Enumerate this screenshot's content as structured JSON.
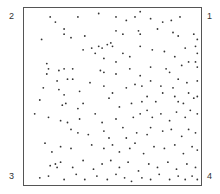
{
  "figure": {
    "corner_labels": {
      "top_right": "1",
      "top_left": "2",
      "bottom_left": "3",
      "bottom_right": "4"
    },
    "colors": {
      "point": "#333333",
      "frame": "#555555",
      "label": "#333333"
    }
  },
  "chart_data": {
    "type": "scatter",
    "title": "",
    "xlabel": "",
    "ylabel": "",
    "xlim": [
      0,
      1
    ],
    "ylim": [
      0,
      1
    ],
    "grid": false,
    "legend": null,
    "annotations": [
      {
        "text": "1",
        "position": "top-right corner"
      },
      {
        "text": "2",
        "position": "top-left corner"
      },
      {
        "text": "3",
        "position": "bottom-left corner"
      },
      {
        "text": "4",
        "position": "bottom-right corner"
      }
    ],
    "note": "Point pattern in unit square; density increases toward the right edge (corners 1 and 4). Coordinates estimated from pixels.",
    "points": [
      [
        0.14,
        0.96
      ],
      [
        0.17,
        0.93
      ],
      [
        0.3,
        0.96
      ],
      [
        0.42,
        0.98
      ],
      [
        0.52,
        0.96
      ],
      [
        0.58,
        0.94
      ],
      [
        0.63,
        0.96
      ],
      [
        0.66,
        0.99
      ],
      [
        0.72,
        0.95
      ],
      [
        0.79,
        0.93
      ],
      [
        0.84,
        0.94
      ],
      [
        0.89,
        0.96
      ],
      [
        0.22,
        0.89
      ],
      [
        0.22,
        0.86
      ],
      [
        0.26,
        0.84
      ],
      [
        0.34,
        0.85
      ],
      [
        0.09,
        0.83
      ],
      [
        0.52,
        0.88
      ],
      [
        0.56,
        0.86
      ],
      [
        0.65,
        0.88
      ],
      [
        0.66,
        0.86
      ],
      [
        0.76,
        0.89
      ],
      [
        0.85,
        0.87
      ],
      [
        0.88,
        0.85
      ],
      [
        0.97,
        0.86
      ],
      [
        0.99,
        0.83
      ],
      [
        0.33,
        0.77
      ],
      [
        0.38,
        0.78
      ],
      [
        0.42,
        0.79
      ],
      [
        0.44,
        0.78
      ],
      [
        0.47,
        0.8
      ],
      [
        0.49,
        0.81
      ],
      [
        0.5,
        0.79
      ],
      [
        0.4,
        0.75
      ],
      [
        0.45,
        0.72
      ],
      [
        0.52,
        0.7
      ],
      [
        0.56,
        0.75
      ],
      [
        0.6,
        0.73
      ],
      [
        0.66,
        0.79
      ],
      [
        0.73,
        0.77
      ],
      [
        0.8,
        0.76
      ],
      [
        0.86,
        0.73
      ],
      [
        0.92,
        0.78
      ],
      [
        0.98,
        0.79
      ],
      [
        0.99,
        0.75
      ],
      [
        0.12,
        0.69
      ],
      [
        0.13,
        0.66
      ],
      [
        0.19,
        0.65
      ],
      [
        0.22,
        0.66
      ],
      [
        0.27,
        0.66
      ],
      [
        0.12,
        0.63
      ],
      [
        0.18,
        0.59
      ],
      [
        0.24,
        0.6
      ],
      [
        0.27,
        0.6
      ],
      [
        0.37,
        0.58
      ],
      [
        0.43,
        0.65
      ],
      [
        0.45,
        0.64
      ],
      [
        0.52,
        0.63
      ],
      [
        0.6,
        0.66
      ],
      [
        0.66,
        0.62
      ],
      [
        0.72,
        0.67
      ],
      [
        0.81,
        0.66
      ],
      [
        0.83,
        0.64
      ],
      [
        0.9,
        0.68
      ],
      [
        0.94,
        0.7
      ],
      [
        0.98,
        0.7
      ],
      [
        0.99,
        0.67
      ],
      [
        0.1,
        0.55
      ],
      [
        0.19,
        0.54
      ],
      [
        0.22,
        0.51
      ],
      [
        0.31,
        0.53
      ],
      [
        0.45,
        0.56
      ],
      [
        0.5,
        0.52
      ],
      [
        0.58,
        0.55
      ],
      [
        0.63,
        0.57
      ],
      [
        0.67,
        0.56
      ],
      [
        0.72,
        0.59
      ],
      [
        0.78,
        0.56
      ],
      [
        0.85,
        0.55
      ],
      [
        0.88,
        0.6
      ],
      [
        0.93,
        0.58
      ],
      [
        0.99,
        0.59
      ],
      [
        0.08,
        0.48
      ],
      [
        0.21,
        0.45
      ],
      [
        0.23,
        0.46
      ],
      [
        0.3,
        0.43
      ],
      [
        0.33,
        0.46
      ],
      [
        0.4,
        0.4
      ],
      [
        0.48,
        0.49
      ],
      [
        0.54,
        0.44
      ],
      [
        0.61,
        0.46
      ],
      [
        0.67,
        0.47
      ],
      [
        0.7,
        0.5
      ],
      [
        0.75,
        0.47
      ],
      [
        0.79,
        0.52
      ],
      [
        0.86,
        0.5
      ],
      [
        0.88,
        0.47
      ],
      [
        0.91,
        0.46
      ],
      [
        0.94,
        0.52
      ],
      [
        0.97,
        0.49
      ],
      [
        0.99,
        0.5
      ],
      [
        0.05,
        0.4
      ],
      [
        0.13,
        0.38
      ],
      [
        0.2,
        0.36
      ],
      [
        0.24,
        0.35
      ],
      [
        0.31,
        0.37
      ],
      [
        0.44,
        0.35
      ],
      [
        0.52,
        0.37
      ],
      [
        0.56,
        0.32
      ],
      [
        0.62,
        0.38
      ],
      [
        0.66,
        0.4
      ],
      [
        0.7,
        0.42
      ],
      [
        0.73,
        0.38
      ],
      [
        0.78,
        0.4
      ],
      [
        0.83,
        0.36
      ],
      [
        0.87,
        0.41
      ],
      [
        0.92,
        0.38
      ],
      [
        0.95,
        0.42
      ],
      [
        0.99,
        0.4
      ],
      [
        0.26,
        0.31
      ],
      [
        0.3,
        0.29
      ],
      [
        0.36,
        0.28
      ],
      [
        0.45,
        0.3
      ],
      [
        0.48,
        0.26
      ],
      [
        0.58,
        0.26
      ],
      [
        0.64,
        0.29
      ],
      [
        0.7,
        0.28
      ],
      [
        0.72,
        0.32
      ],
      [
        0.79,
        0.3
      ],
      [
        0.84,
        0.31
      ],
      [
        0.9,
        0.27
      ],
      [
        0.94,
        0.31
      ],
      [
        0.98,
        0.29
      ],
      [
        0.11,
        0.23
      ],
      [
        0.15,
        0.18
      ],
      [
        0.2,
        0.21
      ],
      [
        0.26,
        0.2
      ],
      [
        0.38,
        0.22
      ],
      [
        0.45,
        0.2
      ],
      [
        0.5,
        0.22
      ],
      [
        0.54,
        0.18
      ],
      [
        0.6,
        0.2
      ],
      [
        0.63,
        0.23
      ],
      [
        0.68,
        0.17
      ],
      [
        0.74,
        0.21
      ],
      [
        0.8,
        0.2
      ],
      [
        0.86,
        0.22
      ],
      [
        0.91,
        0.17
      ],
      [
        0.96,
        0.21
      ],
      [
        0.99,
        0.19
      ],
      [
        0.14,
        0.1
      ],
      [
        0.17,
        0.11
      ],
      [
        0.18,
        0.09
      ],
      [
        0.2,
        0.12
      ],
      [
        0.27,
        0.09
      ],
      [
        0.33,
        0.13
      ],
      [
        0.39,
        0.08
      ],
      [
        0.44,
        0.11
      ],
      [
        0.49,
        0.13
      ],
      [
        0.54,
        0.09
      ],
      [
        0.59,
        0.12
      ],
      [
        0.65,
        0.07
      ],
      [
        0.71,
        0.11
      ],
      [
        0.76,
        0.09
      ],
      [
        0.82,
        0.12
      ],
      [
        0.87,
        0.08
      ],
      [
        0.93,
        0.11
      ],
      [
        0.98,
        0.09
      ],
      [
        0.08,
        0.03
      ],
      [
        0.13,
        0.04
      ],
      [
        0.22,
        0.02
      ],
      [
        0.29,
        0.05
      ],
      [
        0.34,
        0.02
      ],
      [
        0.41,
        0.04
      ],
      [
        0.47,
        0.02
      ],
      [
        0.52,
        0.05
      ],
      [
        0.57,
        0.03
      ],
      [
        0.61,
        0.01
      ],
      [
        0.67,
        0.03
      ],
      [
        0.72,
        0.02
      ],
      [
        0.77,
        0.05
      ],
      [
        0.83,
        0.02
      ],
      [
        0.88,
        0.04
      ],
      [
        0.92,
        0.02
      ],
      [
        0.96,
        0.04
      ],
      [
        0.99,
        0.02
      ]
    ]
  }
}
